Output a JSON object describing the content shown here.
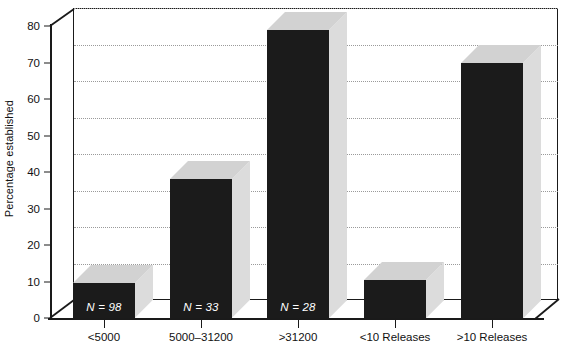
{
  "chart_data": {
    "type": "bar",
    "title": "",
    "subtitle": "",
    "xlabel": "",
    "ylabel": "Percentage established",
    "ylim": [
      0,
      80
    ],
    "ytick_values": [
      0,
      10,
      20,
      30,
      40,
      50,
      60,
      70,
      80
    ],
    "ytick_labels": [
      "0",
      "10",
      "20",
      "30",
      "40",
      "50",
      "60",
      "70",
      "80"
    ],
    "grid": "horizontal-dotted",
    "legend": "none",
    "style": "3d-bar",
    "categories": [
      "<5000",
      "5000–31200",
      ">31200",
      "<10 Releases",
      ">10 Releases"
    ],
    "values": [
      9.5,
      38,
      79,
      10.5,
      70
    ],
    "annotations": [
      "N = 98",
      "N = 33",
      "N = 28",
      "",
      ""
    ],
    "bars": [
      {
        "category": "<5000",
        "value": 9.5,
        "n_label": "N = 98"
      },
      {
        "category": "5000–31200",
        "value": 38,
        "n_label": "N = 33"
      },
      {
        "category": ">31200",
        "value": 79,
        "n_label": "N = 28"
      },
      {
        "category": "<10 Releases",
        "value": 10.5,
        "n_label": ""
      },
      {
        "category": ">10 Releases",
        "value": 70,
        "n_label": ""
      }
    ],
    "colors": {
      "bar_front": "#1b1b1b",
      "bar_depth_top": "#d2d2d2",
      "bar_depth_side": "#dcdcdc",
      "axis": "#1a1a1a",
      "gridline": "#9a9a9a",
      "background": "#ffffff",
      "label_text": "#111111",
      "n_label_text": "#ffffff"
    }
  }
}
